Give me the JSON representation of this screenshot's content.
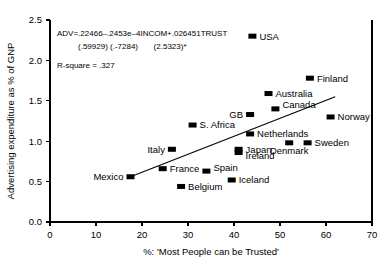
{
  "chart_data": {
    "type": "scatter",
    "title": "",
    "xlabel": "%: 'Most People can be Trusted'",
    "ylabel": "Advertising expenditure as % of GNP",
    "xlim": [
      0,
      70
    ],
    "ylim": [
      0.0,
      2.5
    ],
    "xticks": [
      "0",
      "10",
      "20",
      "30",
      "40",
      "50",
      "60",
      "70"
    ],
    "yticks": [
      "0.0",
      "0.5",
      "1.0",
      "1.5",
      "2.0",
      "2.5"
    ],
    "grid": false,
    "legend": "none",
    "marker_color": "#000000",
    "line_color": "#000000",
    "points": [
      {
        "label": "USA",
        "x": 44.0,
        "y": 2.3,
        "label_pos": "right"
      },
      {
        "label": "Finland",
        "x": 56.5,
        "y": 1.78,
        "label_pos": "right"
      },
      {
        "label": "Australia",
        "x": 47.5,
        "y": 1.59,
        "label_pos": "right"
      },
      {
        "label": "Canada",
        "x": 49.0,
        "y": 1.4,
        "label_pos": "right-up"
      },
      {
        "label": "GB",
        "x": 43.5,
        "y": 1.33,
        "label_pos": "left"
      },
      {
        "label": "Norway",
        "x": 61.0,
        "y": 1.3,
        "label_pos": "right"
      },
      {
        "label": "S. Africa",
        "x": 31.0,
        "y": 1.2,
        "label_pos": "right"
      },
      {
        "label": "Netherlands",
        "x": 43.5,
        "y": 1.09,
        "label_pos": "right"
      },
      {
        "label": "Denmark",
        "x": 52.0,
        "y": 0.98,
        "label_pos": "below"
      },
      {
        "label": "Sweden",
        "x": 56.0,
        "y": 0.98,
        "label_pos": "right"
      },
      {
        "label": "Italy",
        "x": 26.5,
        "y": 0.9,
        "label_pos": "left"
      },
      {
        "label": "Japan",
        "x": 41.0,
        "y": 0.9,
        "label_pos": "right"
      },
      {
        "label": "Ireland",
        "x": 41.0,
        "y": 0.86,
        "label_pos": "right-down"
      },
      {
        "label": "France",
        "x": 24.5,
        "y": 0.66,
        "label_pos": "right"
      },
      {
        "label": "Spain",
        "x": 34.0,
        "y": 0.63,
        "label_pos": "right-up"
      },
      {
        "label": "Mexico",
        "x": 17.5,
        "y": 0.56,
        "label_pos": "left"
      },
      {
        "label": "Iceland",
        "x": 39.5,
        "y": 0.52,
        "label_pos": "right"
      },
      {
        "label": "Belgium",
        "x": 28.5,
        "y": 0.44,
        "label_pos": "right"
      }
    ],
    "trend_line": {
      "x0": 17.5,
      "y0": 0.56,
      "x1": 62.0,
      "y1": 1.55
    },
    "annotations": {
      "equation": "ADV=.22466–.2453e–4INCOM+.026451TRUST",
      "statistics": "(.59929) (.-7284)       (2.5323)*",
      "r_square": "R-square = .327"
    }
  }
}
